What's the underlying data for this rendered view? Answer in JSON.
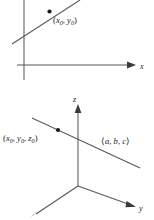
{
  "figure_2d": {
    "name": "line-in-plane",
    "axes": [
      {
        "id": "x",
        "label": "x",
        "orientation": "horizontal",
        "arrow": true
      },
      {
        "id": "y",
        "label": "",
        "orientation": "vertical",
        "arrow": false
      }
    ],
    "point": {
      "label_open": "(",
      "label_x": "x",
      "label_x_sub": "0",
      "label_sep": ", ",
      "label_y": "y",
      "label_y_sub": "0",
      "label_close": ")"
    }
  },
  "figure_3d": {
    "name": "line-in-space",
    "axes": [
      {
        "id": "z",
        "label": "z",
        "orientation": "vertical",
        "arrow": true
      },
      {
        "id": "y",
        "label": "y",
        "orientation": "right",
        "arrow": true
      },
      {
        "id": "x",
        "label": "",
        "orientation": "front-left",
        "arrow": true
      }
    ],
    "point": {
      "label_open": "(",
      "label_x": "x",
      "label_x_sub": "0",
      "label_sep1": ", ",
      "label_y": "y",
      "label_y_sub": "0",
      "label_sep2": ", ",
      "label_z": "z",
      "label_z_sub": "0",
      "label_close": ")"
    },
    "direction_vector": {
      "label_open": "⟨",
      "label_a": "a",
      "label_sep1": ", ",
      "label_b": "b",
      "label_sep2": ", ",
      "label_c": "c",
      "label_close": "⟩"
    }
  },
  "colors": {
    "stroke": "#58585a",
    "ink": "#1b1b1d",
    "background": "#ffffff"
  }
}
